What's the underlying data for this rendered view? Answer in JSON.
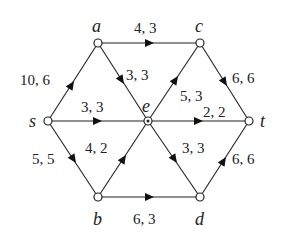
{
  "diagram": {
    "type": "flow-network",
    "nodes": [
      {
        "id": "s",
        "label": "s",
        "x": 48,
        "y": 121
      },
      {
        "id": "a",
        "label": "a",
        "x": 98,
        "y": 43
      },
      {
        "id": "c",
        "label": "c",
        "x": 200,
        "y": 43
      },
      {
        "id": "e",
        "label": "e",
        "x": 148,
        "y": 121
      },
      {
        "id": "t",
        "label": "t",
        "x": 249,
        "y": 121
      },
      {
        "id": "b",
        "label": "b",
        "x": 98,
        "y": 197
      },
      {
        "id": "d",
        "label": "d",
        "x": 200,
        "y": 197
      }
    ],
    "edges": [
      {
        "from": "s",
        "to": "a",
        "label": "10, 6"
      },
      {
        "from": "a",
        "to": "c",
        "label": "4, 3"
      },
      {
        "from": "a",
        "to": "e",
        "label": "3, 3"
      },
      {
        "from": "s",
        "to": "e",
        "label": "3, 3"
      },
      {
        "from": "e",
        "to": "c",
        "label": "5, 3"
      },
      {
        "from": "c",
        "to": "t",
        "label": "6, 6"
      },
      {
        "from": "e",
        "to": "t",
        "label": "2, 2"
      },
      {
        "from": "s",
        "to": "b",
        "label": "5, 5"
      },
      {
        "from": "b",
        "to": "e",
        "label": "4, 2"
      },
      {
        "from": "e",
        "to": "d",
        "label": "3, 3"
      },
      {
        "from": "b",
        "to": "d",
        "label": "6, 3"
      },
      {
        "from": "d",
        "to": "t",
        "label": "6, 6"
      }
    ]
  }
}
